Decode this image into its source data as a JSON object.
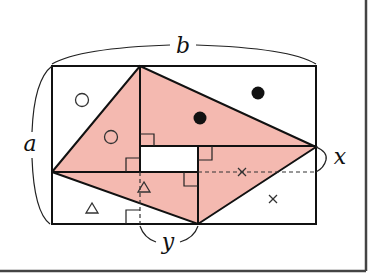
{
  "diagram": {
    "type": "geometry",
    "colors": {
      "fill": "#f4b9b0",
      "stroke": "#111111",
      "frame": "#444444"
    },
    "labels": {
      "b": "b",
      "a": "a",
      "x": "x",
      "y": "y"
    },
    "markers": {
      "circle": "○",
      "dot": "●",
      "triangle": "△",
      "cross": "×"
    }
  }
}
